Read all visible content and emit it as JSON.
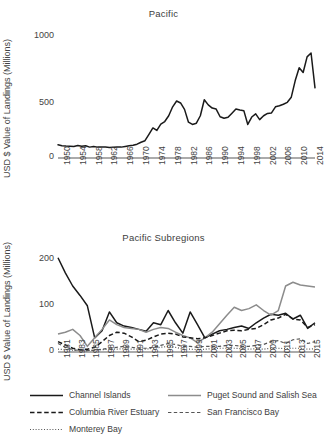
{
  "figure": {
    "ylabel": "USD $ Value of Landings (Millions)"
  },
  "chart_data": [
    {
      "id": "pacific",
      "type": "line",
      "title": "Pacific",
      "xlabel": "",
      "ylabel": "USD $ Value of Landings (Millions)",
      "ylim": [
        0,
        1000
      ],
      "yticks": [
        0,
        500,
        1000
      ],
      "ytick_labels": [
        "0",
        "500",
        "1000"
      ],
      "xlim": [
        1950,
        2015
      ],
      "xticks": [
        1950,
        1954,
        1958,
        1962,
        1966,
        1970,
        1974,
        1978,
        1982,
        1986,
        1990,
        1994,
        1998,
        2002,
        2006,
        2010,
        2014
      ],
      "xtick_labels": [
        "1950",
        "1954",
        "1958",
        "1962",
        "1966",
        "1970",
        "1974",
        "1978",
        "1982",
        "1986",
        "1990",
        "1994",
        "1998",
        "2002",
        "2006",
        "2010",
        "2014"
      ],
      "grid": false,
      "legend": "none",
      "series": [
        {
          "name": "Pacific",
          "color": "#1a1a1a",
          "style": "solid",
          "x": [
            1950,
            1951,
            1952,
            1953,
            1954,
            1955,
            1956,
            1957,
            1958,
            1959,
            1960,
            1961,
            1962,
            1963,
            1964,
            1965,
            1966,
            1967,
            1968,
            1969,
            1970,
            1971,
            1972,
            1973,
            1974,
            1975,
            1976,
            1977,
            1978,
            1979,
            1980,
            1981,
            1982,
            1983,
            1984,
            1985,
            1986,
            1987,
            1988,
            1989,
            1990,
            1991,
            1992,
            1993,
            1994,
            1995,
            1996,
            1997,
            1998,
            1999,
            2000,
            2001,
            2002,
            2003,
            2004,
            2005,
            2006,
            2007,
            2008,
            2009,
            2010,
            2011,
            2012,
            2013,
            2014,
            2015
          ],
          "y": [
            103,
            96,
            93,
            92,
            90,
            98,
            91,
            96,
            85,
            90,
            85,
            85,
            86,
            82,
            84,
            86,
            85,
            90,
            95,
            100,
            108,
            123,
            135,
            185,
            235,
            215,
            265,
            285,
            330,
            400,
            445,
            430,
            380,
            280,
            262,
            272,
            330,
            455,
            415,
            390,
            382,
            322,
            310,
            318,
            350,
            382,
            375,
            370,
            262,
            320,
            345,
            300,
            330,
            348,
            352,
            400,
            408,
            420,
            435,
            475,
            605,
            705,
            668,
            790,
            820,
            548
          ]
        }
      ]
    },
    {
      "id": "pacific-subregions",
      "type": "line",
      "title": "Pacific Subregions",
      "xlabel": "",
      "ylabel": "USD $ Value of Landings (Millions)",
      "ylim": [
        0,
        210
      ],
      "yticks": [
        0,
        100,
        200
      ],
      "ytick_labels": [
        "0",
        "100",
        "200"
      ],
      "xlim": [
        1981,
        2016
      ],
      "xticks": [
        1981,
        1983,
        1985,
        1987,
        1989,
        1991,
        1993,
        1995,
        1997,
        1999,
        2001,
        2003,
        2005,
        2007,
        2009,
        2011,
        2013,
        2015
      ],
      "xtick_labels": [
        "1981",
        "1983",
        "1985",
        "1987",
        "1989",
        "1991",
        "1993",
        "1995",
        "1997",
        "1999",
        "2001",
        "2003",
        "2005",
        "2007",
        "2009",
        "2011",
        "2013",
        "2015"
      ],
      "grid": false,
      "legend": "bottom",
      "x": [
        1981,
        1982,
        1983,
        1984,
        1985,
        1986,
        1987,
        1988,
        1989,
        1990,
        1991,
        1992,
        1993,
        1994,
        1995,
        1996,
        1997,
        1998,
        1999,
        2000,
        2001,
        2002,
        2003,
        2004,
        2005,
        2006,
        2007,
        2008,
        2009,
        2010,
        2011,
        2012,
        2013,
        2014,
        2015,
        2016
      ],
      "series": [
        {
          "name": "Channel Islands",
          "color": "#1a1a1a",
          "style": "solid",
          "y": [
            200,
            168,
            140,
            120,
            98,
            30,
            45,
            85,
            62,
            55,
            52,
            48,
            44,
            62,
            58,
            88,
            62,
            40,
            85,
            58,
            30,
            38,
            45,
            48,
            52,
            55,
            50,
            62,
            72,
            80,
            78,
            82,
            70,
            78,
            50,
            62
          ]
        },
        {
          "name": "Puget Sound and Salish Sea",
          "color": "#8c8c8c",
          "style": "solid",
          "y": [
            38,
            42,
            48,
            35,
            12,
            30,
            48,
            68,
            58,
            52,
            50,
            48,
            42,
            48,
            52,
            50,
            42,
            35,
            30,
            20,
            30,
            42,
            60,
            78,
            95,
            88,
            92,
            100,
            88,
            78,
            88,
            140,
            148,
            142,
            140,
            138
          ]
        },
        {
          "name": "Columbia River Estuary",
          "color": "#1a1a1a",
          "style": "dashed",
          "y": [
            22,
            15,
            8,
            5,
            6,
            10,
            22,
            35,
            42,
            40,
            32,
            22,
            25,
            32,
            38,
            40,
            38,
            32,
            30,
            28,
            30,
            35,
            40,
            45,
            46,
            45,
            48,
            50,
            58,
            68,
            72,
            80,
            70,
            68,
            52,
            58
          ]
        },
        {
          "name": "San Francisco Bay",
          "color": "#555555",
          "style": "dashed-fine",
          "y": [
            18,
            10,
            5,
            3,
            3,
            4,
            6,
            8,
            10,
            12,
            10,
            8,
            8,
            10,
            14,
            18,
            16,
            12,
            12,
            10,
            12,
            12,
            12,
            14,
            14,
            12,
            12,
            14,
            16,
            22,
            24,
            18,
            26,
            28,
            18,
            22
          ]
        },
        {
          "name": "Monterey Bay",
          "color": "#555555",
          "style": "dotted",
          "y": [
            6,
            5,
            4,
            3,
            3,
            4,
            5,
            6,
            6,
            7,
            6,
            6,
            6,
            8,
            10,
            12,
            10,
            6,
            6,
            5,
            6,
            7,
            8,
            8,
            8,
            7,
            6,
            7,
            6,
            8,
            8,
            7,
            8,
            8,
            6,
            7
          ]
        }
      ],
      "legend_items": [
        {
          "label": "Channel Islands",
          "color": "#1a1a1a",
          "style": "solid"
        },
        {
          "label": "Puget Sound and Salish Sea",
          "color": "#8c8c8c",
          "style": "solid"
        },
        {
          "label": "Columbia River Estuary",
          "color": "#1a1a1a",
          "style": "dashed"
        },
        {
          "label": "San Francisco Bay",
          "color": "#555555",
          "style": "dashed-fine"
        },
        {
          "label": "Monterey Bay",
          "color": "#555555",
          "style": "dotted"
        }
      ]
    }
  ]
}
